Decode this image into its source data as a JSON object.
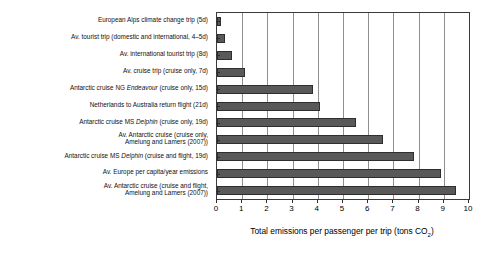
{
  "chart_data": {
    "type": "bar",
    "orientation": "horizontal",
    "title": "",
    "xlabel": "Total emissions per passenger per trip (tons CO2)",
    "ylabel": "",
    "xlim": [
      0,
      10
    ],
    "xticks": [
      0,
      1,
      2,
      3,
      4,
      5,
      6,
      7,
      8,
      9,
      10
    ],
    "grid": true,
    "grid_axis": "x",
    "legend": false,
    "bar_color": "#595959",
    "bar_edge_color": "#2e2e2e",
    "categories": [
      "European Alps climate change trip (5d)",
      "Av. tourist trip (domestic and international, 4–5d)",
      "Av. international tourist trip (8d)",
      "Av. cruise trip (cruise only, 7d)",
      "Antarctic cruise NG Endeavour (cruise only, 15d)",
      "Netherlands to Australia return flight (21d)",
      "Antarctic cruise MS Delphin (cruise only, 19d)",
      "Av. Antarctic cruise (cruise only,\nAmelung and Lamers (2007))",
      "Antarctic cruise MS Delphin (cruise and flight, 19d)",
      "Av. Europe per capita/year emissions",
      "Av. Antarctic cruise (cruise and flight,\nAmelung and Lamers (2007))"
    ],
    "values": [
      0.15,
      0.3,
      0.6,
      1.1,
      3.8,
      4.1,
      5.5,
      6.6,
      7.8,
      8.9,
      9.5
    ]
  },
  "axis": {
    "x_title_main": "Total emissions per passenger per trip (tons CO",
    "x_title_sub": "2",
    "x_title_end": ")"
  }
}
